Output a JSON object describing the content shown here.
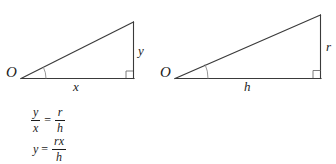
{
  "figure": {
    "type": "geometry-diagram",
    "stroke_color": "#3a3a3a",
    "text_color": "#1b1b1b",
    "background_color": "#ffffff",
    "triangles": [
      {
        "id": "left-triangle",
        "vertex_label": "O",
        "base_label": "x",
        "height_label": "y",
        "has_angle_arc": true,
        "has_right_angle_marker": true
      },
      {
        "id": "right-triangle",
        "vertex_label": "O",
        "base_label": "h",
        "height_label": "r",
        "has_angle_arc": true,
        "has_right_angle_marker": true
      }
    ]
  },
  "equations": [
    {
      "id": "proportion",
      "left": {
        "numerator": "y",
        "denominator": "x"
      },
      "relation": "=",
      "right": {
        "numerator": "r",
        "denominator": "h"
      },
      "plain": "y/x = r/h"
    },
    {
      "id": "solved-for-y",
      "left_term": "y",
      "relation": "=",
      "right": {
        "numerator": "rx",
        "denominator": "h"
      },
      "plain": "y = rx/h"
    }
  ]
}
